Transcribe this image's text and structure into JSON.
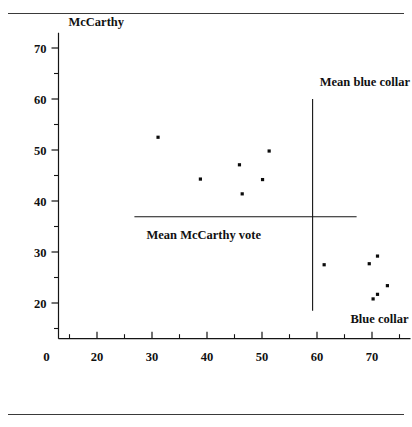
{
  "chart_data": {
    "type": "scatter",
    "title": "",
    "xlabel": "Blue collar",
    "ylabel": "McCarthy",
    "xlim": [
      13,
      77
    ],
    "ylim": [
      13,
      73
    ],
    "grid": false,
    "legend": "none",
    "origin_label": "0",
    "x_ticks_major": [
      20,
      30,
      40,
      50,
      60,
      70
    ],
    "x_ticks_minor": [
      15,
      25,
      35,
      45,
      55,
      65,
      75
    ],
    "x_tick_labels": [
      "20",
      "30",
      "40",
      "50",
      "60",
      "70"
    ],
    "y_ticks_major": [
      20,
      30,
      40,
      50,
      60,
      70
    ],
    "y_ticks_minor": [
      15,
      25,
      35,
      45,
      55,
      65
    ],
    "y_tick_labels": [
      "20",
      "30",
      "40",
      "50",
      "60",
      "70"
    ],
    "points": [
      {
        "x": 31.1,
        "y": 52.5
      },
      {
        "x": 38.8,
        "y": 44.3
      },
      {
        "x": 45.9,
        "y": 47.1
      },
      {
        "x": 46.4,
        "y": 41.4
      },
      {
        "x": 50.1,
        "y": 44.2
      },
      {
        "x": 51.3,
        "y": 49.8
      },
      {
        "x": 61.3,
        "y": 27.5
      },
      {
        "x": 69.5,
        "y": 27.7
      },
      {
        "x": 71.0,
        "y": 29.2
      },
      {
        "x": 70.2,
        "y": 20.8
      },
      {
        "x": 71.0,
        "y": 21.7
      },
      {
        "x": 72.8,
        "y": 23.4
      }
    ],
    "annotations": [
      {
        "name": "mean-blue-collar",
        "label": "Mean blue collar",
        "orientation": "vertical",
        "value": 59.2,
        "span": [
          18.5,
          60.0
        ],
        "label_x": 60.5,
        "label_y": 62.5
      },
      {
        "name": "mean-mccarthy-vote",
        "label": "Mean McCarthy vote",
        "orientation": "horizontal",
        "value": 36.9,
        "span": [
          26.8,
          67.2
        ],
        "label_x": 29.0,
        "label_y": 32.6
      }
    ],
    "series": [
      {
        "name": "counties",
        "point_color": "#0b0b0b",
        "values": [
          52.5,
          44.3,
          47.1,
          41.4,
          44.2,
          49.8,
          27.5,
          27.7,
          29.2,
          20.8,
          21.7,
          23.4
        ],
        "x": [
          31.1,
          38.8,
          45.9,
          46.4,
          50.1,
          51.3,
          61.3,
          69.5,
          71.0,
          70.2,
          71.0,
          72.8
        ]
      }
    ]
  }
}
